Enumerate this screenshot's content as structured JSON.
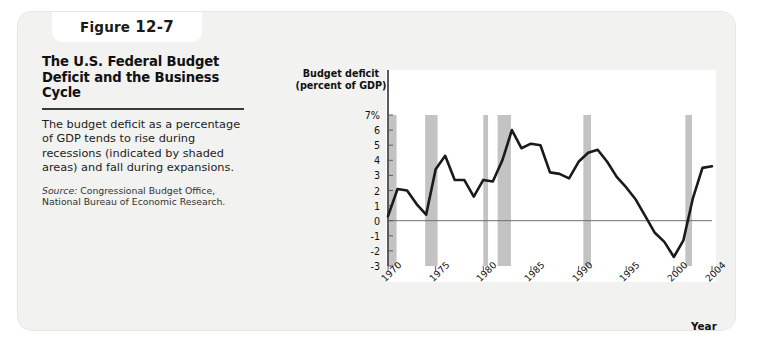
{
  "figure": {
    "tab_label": "Figure",
    "tab_number": "12-7",
    "title": "The U.S. Federal Budget Deficit and the Business Cycle",
    "description": "The budget deficit as a percentage of GDP tends to rise during recessions (indicated by shaded areas) and fall during expansions.",
    "source_label": "Source:",
    "source_text": " Congressional Budget Office, National Bureau of Economic Research."
  },
  "colors": {
    "card_background": "#f2f2f1",
    "panel_background": "#ffffff",
    "line": "#1a1a1a",
    "recession_band": "#c3c3c3",
    "axis": "#5a5a5a",
    "zero_line": "#6e6e6e",
    "text": "#111111"
  },
  "chart_data": {
    "type": "line",
    "title": "The U.S. Federal Budget Deficit and the Business Cycle",
    "xlabel": "Year",
    "ylabel": "Budget deficit (percent of GDP)",
    "ylabel_line1": "Budget deficit",
    "ylabel_line2": "(percent of GDP)",
    "xlim": [
      1970,
      2004
    ],
    "ylim": [
      -3,
      7
    ],
    "grid": false,
    "legend": "none",
    "ytick_labels": [
      "7%",
      "6",
      "5",
      "4",
      "3",
      "2",
      "1",
      "0",
      "-1",
      "-2",
      "-3"
    ],
    "ytick_values": [
      7,
      6,
      5,
      4,
      3,
      2,
      1,
      0,
      -1,
      -2,
      -3
    ],
    "xtick_labels": [
      "1970",
      "1975",
      "1980",
      "1985",
      "1990",
      "1995",
      "2000",
      "2004"
    ],
    "xtick_values": [
      1970,
      1975,
      1980,
      1985,
      1990,
      1995,
      2000,
      2004
    ],
    "zero_line": 0,
    "series": [
      {
        "name": "Budget deficit (percent of GDP)",
        "x": [
          1970,
          1971,
          1972,
          1973,
          1974,
          1975,
          1976,
          1977,
          1978,
          1979,
          1980,
          1981,
          1982,
          1983,
          1984,
          1985,
          1986,
          1987,
          1988,
          1989,
          1990,
          1991,
          1992,
          1993,
          1994,
          1995,
          1996,
          1997,
          1998,
          1999,
          2000,
          2001,
          2002,
          2003,
          2004
        ],
        "values": [
          0.3,
          2.1,
          2.0,
          1.1,
          0.4,
          3.4,
          4.3,
          2.7,
          2.7,
          1.6,
          2.7,
          2.6,
          4.0,
          6.0,
          4.8,
          5.1,
          5.0,
          3.2,
          3.1,
          2.8,
          3.9,
          4.5,
          4.7,
          3.9,
          2.9,
          2.2,
          1.4,
          0.3,
          -0.8,
          -1.4,
          -2.4,
          -1.3,
          1.5,
          3.5,
          3.6
        ]
      }
    ],
    "recession_bands": [
      {
        "start": 1969.9,
        "end": 1970.9,
        "label": "1969-1970 recession"
      },
      {
        "start": 1973.9,
        "end": 1975.2,
        "label": "1973-1975 recession"
      },
      {
        "start": 1980.0,
        "end": 1980.5,
        "label": "1980 recession"
      },
      {
        "start": 1981.5,
        "end": 1982.9,
        "label": "1981-1982 recession"
      },
      {
        "start": 1990.5,
        "end": 1991.3,
        "label": "1990-1991 recession"
      },
      {
        "start": 2001.2,
        "end": 2001.9,
        "label": "2001 recession"
      }
    ]
  }
}
